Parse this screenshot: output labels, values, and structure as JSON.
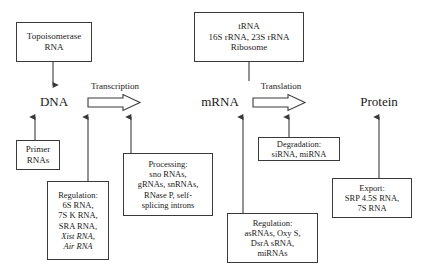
{
  "diagram": {
    "background_color": "#ffffff",
    "line_color": "#3a3a3a",
    "stages": [
      {
        "id": "dna",
        "label": "DNA"
      },
      {
        "id": "mrna",
        "label": "mRNA"
      },
      {
        "id": "protein",
        "label": "Protein"
      }
    ],
    "process_arrows": [
      {
        "id": "transcription",
        "label": "Transcription"
      },
      {
        "id": "translation",
        "label": "Translation"
      }
    ],
    "boxes": [
      {
        "id": "topoisomerase",
        "lines": [
          "Topoisomerase",
          "RNA"
        ]
      },
      {
        "id": "ribosome",
        "lines": [
          "tRNA",
          "16S rRNA, 23S rRNA",
          "Ribosome"
        ]
      },
      {
        "id": "primer",
        "lines": [
          "Primer",
          "RNAs"
        ]
      },
      {
        "id": "regulation-dna",
        "lines": [
          "Regulation:",
          "6S RNA,",
          "7S K RNA,",
          "SRA RNA,",
          "Xist RNA,",
          "Air RNA"
        ],
        "italic_lines": [
          4,
          5
        ]
      },
      {
        "id": "processing",
        "lines": [
          "Processing:",
          "sno RNAs,",
          "gRNAs, snRNAs,",
          "RNase P, self-",
          "splicing introns"
        ]
      },
      {
        "id": "degradation",
        "lines": [
          "Degradation:",
          "siRNA, miRNA"
        ]
      },
      {
        "id": "regulation-mrna",
        "lines": [
          "Regulation:",
          "asRNAs, Oxy S,",
          "DsrA sRNA,",
          "miRNAs"
        ]
      },
      {
        "id": "export",
        "lines": [
          "Export:",
          "SRP 4.5S RNA,",
          "7S RNA"
        ]
      }
    ]
  }
}
